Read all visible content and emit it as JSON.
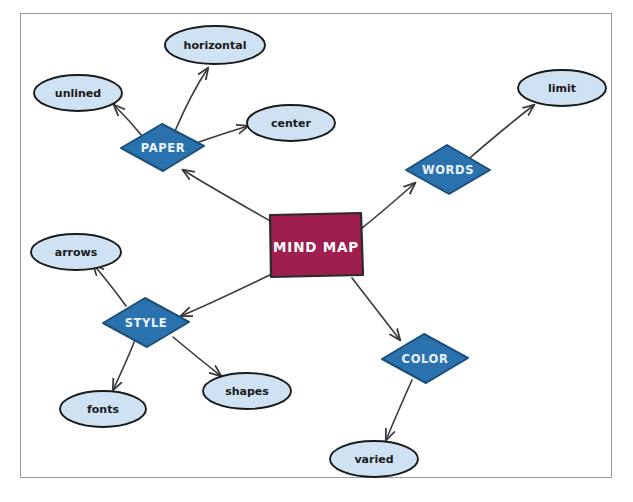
{
  "diagram": {
    "title": "Mind Map",
    "type": "mind-map",
    "style": "hand-drawn sketch",
    "background_color": "#ffffff",
    "frame_color": "#9a9a9a",
    "colors": {
      "center_fill": "#9e1f4f",
      "center_stroke": "#2b2b2b",
      "center_text": "#ffffff",
      "branch_fill": "#2a72ad",
      "branch_stroke": "#1c4f7c",
      "branch_text": "#eaf3fb",
      "leaf_fill": "#cfe2f3",
      "leaf_stroke": "#1a1a1a",
      "leaf_text": "#1a1a1a",
      "connector": "#3a3a3a"
    },
    "center": {
      "label": "MIND MAP",
      "shape": "rectangle"
    },
    "branches": [
      {
        "label": "PAPER",
        "shape": "diamond",
        "leaves": [
          "unlined",
          "horizontal",
          "center"
        ]
      },
      {
        "label": "WORDS",
        "shape": "diamond",
        "leaves": [
          "limit"
        ]
      },
      {
        "label": "STYLE",
        "shape": "diamond",
        "leaves": [
          "arrows",
          "fonts",
          "shapes"
        ]
      },
      {
        "label": "COLOR",
        "shape": "diamond",
        "leaves": [
          "varied"
        ]
      }
    ],
    "leaves": {
      "unlined": "unlined",
      "horizontal": "horizontal",
      "center": "center",
      "limit": "limit",
      "arrows": "arrows",
      "fonts": "fonts",
      "shapes": "shapes",
      "varied": "varied"
    }
  }
}
